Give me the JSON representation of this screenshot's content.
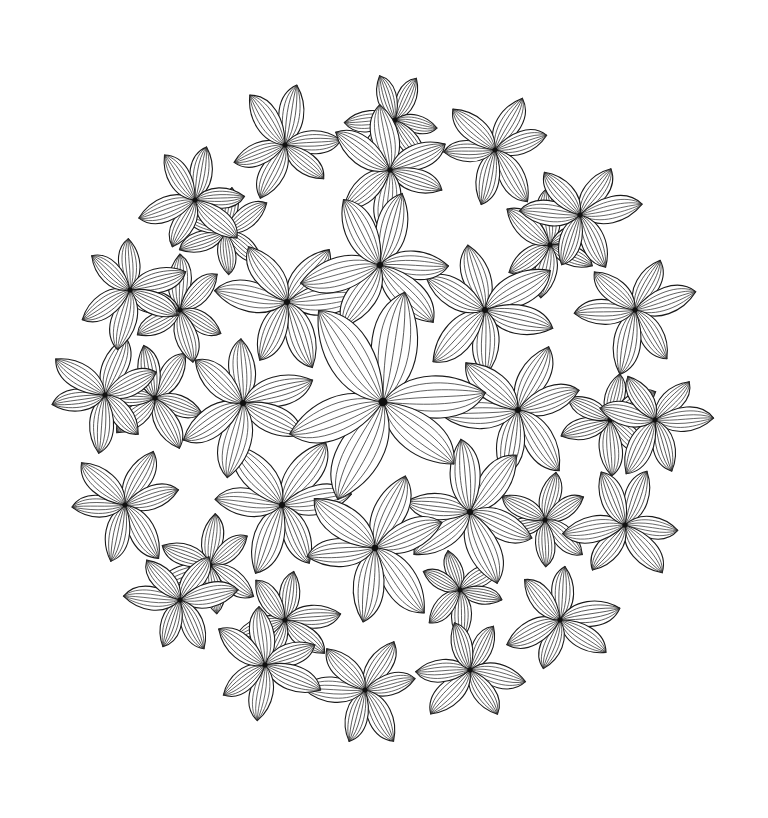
{
  "image": {
    "description": "Black and white line-art floral mandala coloring page with overlapping five/six-petal flowers forming a roughly circular cluster",
    "background": "#ffffff",
    "line_color": "#1a1a1a"
  },
  "flowers": [
    {
      "x": 383,
      "y": 402,
      "r": 110,
      "petals": 6,
      "rot": 10
    },
    {
      "x": 380,
      "y": 265,
      "r": 80,
      "petals": 6,
      "rot": 30
    },
    {
      "x": 485,
      "y": 310,
      "r": 75,
      "petals": 6,
      "rot": 0
    },
    {
      "x": 518,
      "y": 410,
      "r": 75,
      "petals": 6,
      "rot": 20
    },
    {
      "x": 470,
      "y": 512,
      "r": 75,
      "petals": 6,
      "rot": 40
    },
    {
      "x": 375,
      "y": 548,
      "r": 80,
      "petals": 6,
      "rot": 15
    },
    {
      "x": 282,
      "y": 505,
      "r": 75,
      "petals": 6,
      "rot": 35
    },
    {
      "x": 243,
      "y": 403,
      "r": 75,
      "petals": 6,
      "rot": 5
    },
    {
      "x": 287,
      "y": 302,
      "r": 75,
      "petals": 6,
      "rot": 25
    },
    {
      "x": 390,
      "y": 170,
      "r": 65,
      "petals": 6,
      "rot": 0
    },
    {
      "x": 495,
      "y": 150,
      "r": 60,
      "petals": 6,
      "rot": 20
    },
    {
      "x": 285,
      "y": 145,
      "r": 60,
      "petals": 6,
      "rot": 10
    },
    {
      "x": 580,
      "y": 215,
      "r": 62,
      "petals": 6,
      "rot": 30
    },
    {
      "x": 550,
      "y": 245,
      "r": 55,
      "petals": 6,
      "rot": 5
    },
    {
      "x": 635,
      "y": 310,
      "r": 65,
      "petals": 6,
      "rot": 15
    },
    {
      "x": 655,
      "y": 420,
      "r": 60,
      "petals": 6,
      "rot": 40
    },
    {
      "x": 610,
      "y": 420,
      "r": 55,
      "petals": 6,
      "rot": 0
    },
    {
      "x": 625,
      "y": 525,
      "r": 62,
      "petals": 6,
      "rot": 25
    },
    {
      "x": 560,
      "y": 620,
      "r": 60,
      "petals": 6,
      "rot": 10
    },
    {
      "x": 470,
      "y": 670,
      "r": 58,
      "petals": 6,
      "rot": 35
    },
    {
      "x": 365,
      "y": 690,
      "r": 60,
      "petals": 6,
      "rot": 15
    },
    {
      "x": 265,
      "y": 665,
      "r": 60,
      "petals": 6,
      "rot": 5
    },
    {
      "x": 285,
      "y": 620,
      "r": 55,
      "petals": 6,
      "rot": 25
    },
    {
      "x": 180,
      "y": 600,
      "r": 58,
      "petals": 6,
      "rot": 20
    },
    {
      "x": 210,
      "y": 565,
      "r": 55,
      "petals": 6,
      "rot": 0
    },
    {
      "x": 125,
      "y": 505,
      "r": 62,
      "petals": 6,
      "rot": 30
    },
    {
      "x": 105,
      "y": 395,
      "r": 60,
      "petals": 6,
      "rot": 10
    },
    {
      "x": 155,
      "y": 398,
      "r": 55,
      "petals": 6,
      "rot": 35
    },
    {
      "x": 130,
      "y": 290,
      "r": 60,
      "petals": 6,
      "rot": 15
    },
    {
      "x": 180,
      "y": 310,
      "r": 55,
      "petals": 6,
      "rot": 0
    },
    {
      "x": 195,
      "y": 200,
      "r": 58,
      "petals": 6,
      "rot": 25
    },
    {
      "x": 225,
      "y": 232,
      "r": 50,
      "petals": 6,
      "rot": 5
    },
    {
      "x": 395,
      "y": 120,
      "r": 50,
      "petals": 6,
      "rot": 30
    },
    {
      "x": 545,
      "y": 520,
      "r": 50,
      "petals": 6,
      "rot": 15
    },
    {
      "x": 460,
      "y": 590,
      "r": 48,
      "petals": 6,
      "rot": 0
    }
  ]
}
